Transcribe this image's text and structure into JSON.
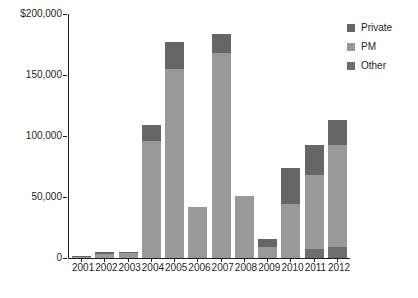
{
  "chart_data": {
    "type": "bar",
    "subtype": "stacked-bar",
    "title": "",
    "xlabel": "",
    "ylabel": "Monetized benefit ($ millions)",
    "ylim": [
      0,
      200000
    ],
    "ytick_labels": [
      "$200,000",
      "150,000",
      "100,000",
      "50,000",
      "0"
    ],
    "ytick_values": [
      200000,
      150000,
      100000,
      50000,
      0
    ],
    "grid": false,
    "legend_position": "top-right",
    "categories": [
      "2001",
      "2002",
      "2003",
      "2004",
      "2005",
      "2006",
      "2007",
      "2008",
      "2009",
      "2010",
      "2011",
      "2012"
    ],
    "series": [
      {
        "name": "Other",
        "color": "#6e6e6e",
        "values": [
          0,
          0,
          0,
          0,
          0,
          0,
          0,
          0,
          0,
          0,
          7000,
          9000
        ]
      },
      {
        "name": "PM",
        "color": "#999999",
        "values": [
          1200,
          3600,
          3800,
          96000,
          155000,
          42000,
          168000,
          51000,
          9000,
          44000,
          61000,
          84000
        ]
      },
      {
        "name": "Private",
        "color": "#666666",
        "values": [
          400,
          1200,
          1400,
          13000,
          22000,
          0,
          16000,
          0,
          6500,
          30000,
          25000,
          20000
        ]
      }
    ],
    "totals": [
      1600,
      4800,
      5200,
      109000,
      177000,
      42000,
      184000,
      51000,
      15500,
      74000,
      93000,
      113000
    ],
    "legend": [
      {
        "label": "Private",
        "color": "#666666"
      },
      {
        "label": "PM",
        "color": "#999999"
      },
      {
        "label": "Other",
        "color": "#6e6e6e"
      }
    ]
  }
}
